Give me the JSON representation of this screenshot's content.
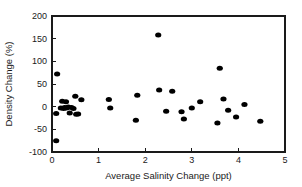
{
  "chart_data": {
    "type": "scatter",
    "title": "",
    "xlabel": "Average Salinity Change (ppt)",
    "ylabel": "Density Change (%)",
    "xlim": [
      0,
      5
    ],
    "ylim": [
      -100,
      200
    ],
    "xticks": [
      0,
      1,
      2,
      3,
      4,
      5
    ],
    "yticks": [
      -100,
      -50,
      0,
      50,
      100,
      150,
      200
    ],
    "xtick_labels": [
      "0",
      "1",
      "2",
      "3",
      "4",
      "5"
    ],
    "ytick_labels": [
      "-100",
      "-50",
      "0",
      "50",
      "100",
      "150",
      "200"
    ],
    "grid": false,
    "legend": false,
    "marker": "filled-circle",
    "marker_color": "#000000",
    "marker_size": 4,
    "series": [
      {
        "name": "Samples",
        "points": [
          [
            0.09,
            -75
          ],
          [
            0.11,
            72
          ],
          [
            0.09,
            -15
          ],
          [
            0.19,
            -3
          ],
          [
            0.22,
            12
          ],
          [
            0.25,
            -4
          ],
          [
            0.27,
            -2
          ],
          [
            0.3,
            11
          ],
          [
            0.31,
            -3
          ],
          [
            0.35,
            -1
          ],
          [
            0.38,
            -14
          ],
          [
            0.42,
            -2
          ],
          [
            0.46,
            -4
          ],
          [
            0.5,
            23
          ],
          [
            0.52,
            -17
          ],
          [
            0.56,
            -16
          ],
          [
            0.63,
            15
          ],
          [
            1.22,
            16
          ],
          [
            1.25,
            -3
          ],
          [
            1.8,
            -30
          ],
          [
            1.83,
            25
          ],
          [
            2.28,
            158
          ],
          [
            2.3,
            37
          ],
          [
            2.45,
            -10
          ],
          [
            2.58,
            34
          ],
          [
            2.78,
            -11
          ],
          [
            2.83,
            -27
          ],
          [
            3.0,
            -3
          ],
          [
            3.18,
            11
          ],
          [
            3.55,
            -36
          ],
          [
            3.6,
            85
          ],
          [
            3.68,
            17
          ],
          [
            3.78,
            -8
          ],
          [
            3.95,
            -23
          ],
          [
            4.13,
            5
          ],
          [
            4.47,
            -32
          ]
        ]
      }
    ]
  },
  "figure": {
    "background_color": "#ffffff",
    "axis_color": "#1a1a1a"
  }
}
